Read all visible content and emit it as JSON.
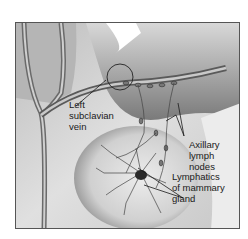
{
  "figure": {
    "labels": [
      {
        "id": "left-subclavian-vein",
        "text": "Left\nsubclavian\nvein"
      },
      {
        "id": "axillary-lymph-nodes",
        "text": "Axillary\nlymph\nnodes"
      },
      {
        "id": "lymphatics-mammary-gland",
        "text": "Lymphatics\nof mammary\ngland"
      }
    ]
  },
  "colors": {
    "frame_border": "#555555",
    "background": "#ffffff",
    "skin_light": "#e6e6e6",
    "skin_dark": "#9a9a9a",
    "vessel": "#444444"
  }
}
